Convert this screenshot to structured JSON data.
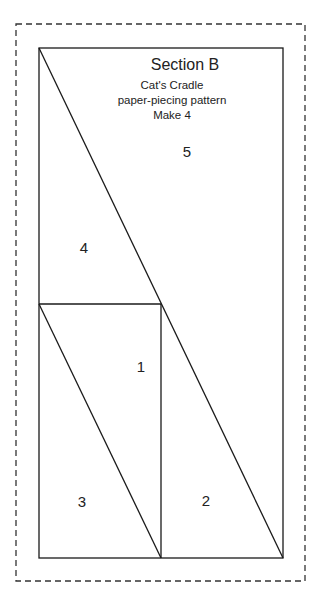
{
  "pattern": {
    "title": "Section B",
    "subtitle_lines": [
      "Cat's Cradle",
      "paper-piecing pattern",
      "Make 4"
    ],
    "pieces": [
      {
        "label": "1",
        "x": 141,
        "y": 369
      },
      {
        "label": "2",
        "x": 206,
        "y": 502
      },
      {
        "label": "3",
        "x": 82,
        "y": 503
      },
      {
        "label": "4",
        "x": 84,
        "y": 249
      },
      {
        "label": "5",
        "x": 187,
        "y": 153
      }
    ],
    "line_color": "#1a1a1a"
  }
}
